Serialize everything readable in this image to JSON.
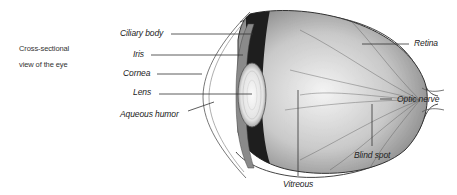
{
  "caption": {
    "line1": "Cross-sectional",
    "line2": "view of the eye"
  },
  "labels": {
    "ciliary_body": "Ciliary body",
    "iris": "Iris",
    "cornea": "Cornea",
    "lens": "Lens",
    "aqueous_humor": "Aqueous humor",
    "retina": "Retina",
    "optic_nerve": "Optic nerve",
    "blind_spot": "Blind spot",
    "vitreous": "Vitreous"
  }
}
